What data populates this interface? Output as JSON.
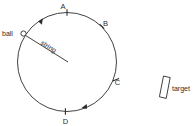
{
  "diagram": {
    "colors": {
      "stroke": "#2b2b2b",
      "background": "#ffffff"
    },
    "circle": {
      "center_x": 67,
      "center_y": 62,
      "radius": 49.5,
      "label": "path-circle"
    },
    "ball": {
      "label": "ball",
      "x": 23.5,
      "y": 33.5,
      "radius": 2.6
    },
    "string": {
      "label": "string",
      "x1": 25.5,
      "y1": 35.5,
      "x2": 68,
      "y2": 62,
      "text_angle": 32
    },
    "points": [
      {
        "label": "A",
        "angle_deg": -90,
        "text_x": 64,
        "text_y": 7
      },
      {
        "label": "B",
        "angle_deg": -45,
        "text_x": 104,
        "text_y": 25
      },
      {
        "label": "C",
        "angle_deg": 22,
        "text_x": 115,
        "text_y": 85
      },
      {
        "label": "D",
        "angle_deg": 90,
        "text_x": 64,
        "text_y": 124
      }
    ],
    "direction_arrows": [
      {
        "name": "arrow-top-left",
        "angle_deg": -153,
        "description": "clockwise"
      },
      {
        "name": "arrow-bottom-right",
        "angle_deg": 72,
        "description": "clockwise"
      }
    ],
    "target": {
      "label": "target",
      "x": 159,
      "y": 76,
      "width": 7,
      "height": 22,
      "tilt_deg": 12,
      "text_x": 172,
      "text_y": 90
    }
  }
}
